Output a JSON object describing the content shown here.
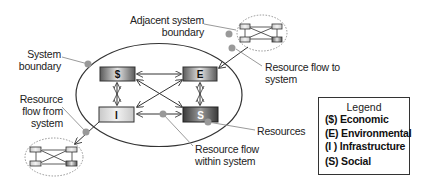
{
  "diagram": {
    "type": "system-resource-flow",
    "nodes": [
      {
        "id": "economic",
        "label": "$"
      },
      {
        "id": "environmental",
        "label": "E"
      },
      {
        "id": "infrastructure",
        "label": "I"
      },
      {
        "id": "social",
        "label": "S"
      }
    ],
    "labels": {
      "adjacent_system_boundary": [
        "Adjacent system",
        "boundary"
      ],
      "system_boundary": [
        "System",
        "boundary"
      ],
      "resource_flow_to_system": [
        "Resource flow to",
        "system"
      ],
      "resource_flow_from_system": [
        "Resource",
        "flow from",
        "system"
      ],
      "resources": [
        "Resources"
      ],
      "resource_flow_within_system": [
        "Resource flow",
        "within system"
      ]
    },
    "legend": {
      "title": "Legend",
      "items": [
        "($) Economic",
        "(E) Environmental",
        "(I ) Infrastructure",
        "(S) Social"
      ]
    },
    "colors": {
      "line": "#333333",
      "callout": "#9a9a9a",
      "dot": "#999999",
      "dashed_boundary": "#888888"
    }
  }
}
